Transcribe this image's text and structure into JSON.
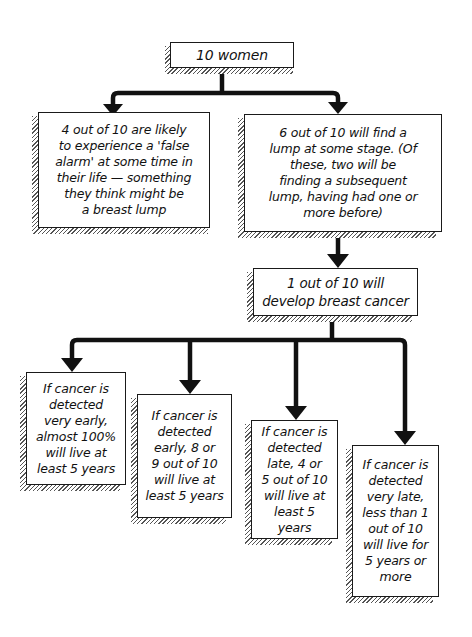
{
  "diagram": {
    "type": "flowchart",
    "root": {
      "label": "10 women"
    },
    "level1": [
      {
        "label": "4 out of 10 are likely\nto experience a 'false\nalarm' at some time in\ntheir life — something\nthey think might be\na breast lump"
      },
      {
        "label": "6 out of 10 will find a\nlump at some stage. (Of\nthese, two will be\nfinding a subsequent\nlump, having had one or\nmore before)"
      }
    ],
    "level2": {
      "label": "1 out of 10 will\ndevelop breast cancer"
    },
    "level3": [
      {
        "label": "If cancer is\ndetected\nvery early,\nalmost 100%\nwill live at\nleast 5 years"
      },
      {
        "label": "If cancer is\ndetected\nearly, 8 or\n9 out of 10\nwill live at\nleast 5 years"
      },
      {
        "label": "If cancer is\ndetected\nlate, 4 or\n5 out of 10\nwill live at\nleast 5 years"
      },
      {
        "label": "If cancer is\ndetected\nvery late,\nless than 1\nout of 10\nwill live for\n5 years or\nmore"
      }
    ],
    "colors": {
      "line": "#111111",
      "box_border": "#1a1a1a",
      "background": "#ffffff"
    }
  }
}
